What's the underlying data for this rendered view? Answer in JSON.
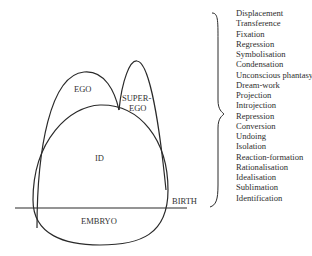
{
  "diagram": {
    "labels": {
      "ego": "EGO",
      "superego_line1": "SUPER-",
      "superego_line2": "EGO",
      "id": "ID",
      "embryo": "EMBRYO",
      "birth": "BIRTH"
    },
    "mechanisms": [
      "Displacement",
      "Transference",
      "Fixation",
      "Regression",
      "Symbolisation",
      "Condensation",
      "Unconscious phantasy",
      "Dream-work",
      "Projection",
      "Introjection",
      "Repression",
      "Conversion",
      "Undoing",
      "Isolation",
      "Reaction-formation",
      "Rationalisation",
      "Idealisation",
      "Sublimation",
      "Identification"
    ],
    "colors": {
      "line": "#2a2a2a",
      "background": "#ffffff"
    }
  }
}
